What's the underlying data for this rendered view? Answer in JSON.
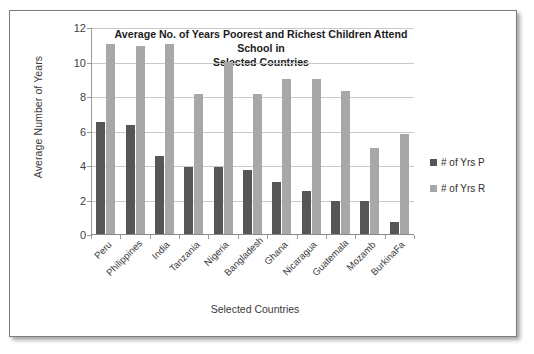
{
  "chart_data": {
    "type": "bar",
    "title": "Average No. of Years Poorest and Richest Children Attend School in Selected Countries",
    "title_line1": "Average No. of Years Poorest and Richest Children Attend School in",
    "title_line2": "Selected Countries",
    "xlabel": "Selected Countries",
    "ylabel": "Average Number of Years",
    "ylim": [
      0,
      12
    ],
    "yticks": [
      0,
      2,
      4,
      6,
      8,
      10,
      12
    ],
    "grid": true,
    "legend_position": "right",
    "categories": [
      "Peru",
      "Philippines",
      "India",
      "Tanzania",
      "Nigeria",
      "Bangladesh",
      "Ghana",
      "Nicaragua",
      "Guatemala",
      "Mozamb",
      "BurkinaFa"
    ],
    "series": [
      {
        "name": "# of Yrs P",
        "color": "#565656",
        "values": [
          6.5,
          6.3,
          4.5,
          3.9,
          3.9,
          3.7,
          3.0,
          2.5,
          1.9,
          1.9,
          0.7
        ]
      },
      {
        "name": "# of Yrs R",
        "color": "#a8a8a8",
        "values": [
          11.0,
          10.9,
          11.0,
          8.1,
          10.0,
          8.1,
          9.0,
          9.0,
          8.3,
          5.0,
          5.8
        ]
      }
    ]
  }
}
